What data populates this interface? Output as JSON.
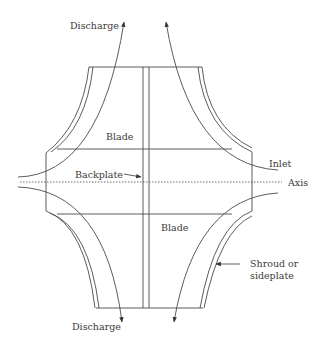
{
  "diagram": {
    "type": "centrifugal impeller cross-section",
    "stroke_color": "#4a4a4a",
    "labels": {
      "discharge_top": "Discharge",
      "discharge_bottom": "Discharge",
      "blade_upper": "Blade",
      "blade_lower": "Blade",
      "backplate": "Backplate",
      "inlet": "Inlet",
      "axis": "Axis",
      "shroud_line1": "Shroud or",
      "shroud_line2": "sideplate"
    }
  }
}
